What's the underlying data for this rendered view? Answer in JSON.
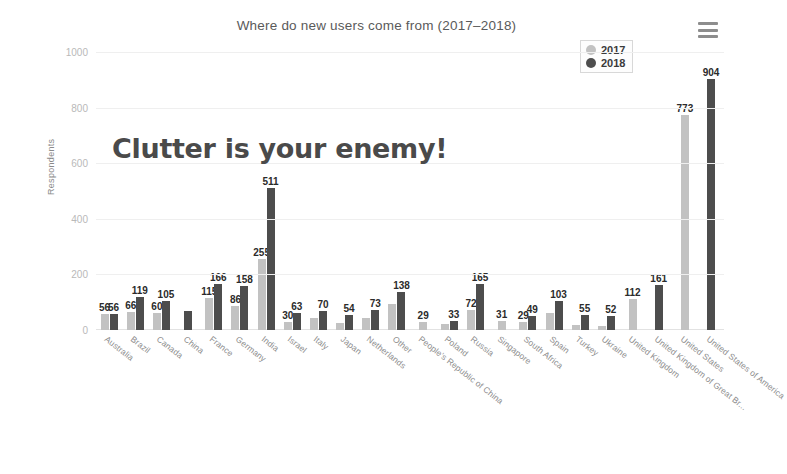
{
  "chart_data": {
    "type": "bar",
    "title": "Where do new users come from (2017–2018)",
    "xlabel": "",
    "ylabel": "Respondents",
    "ylim": [
      0,
      1000
    ],
    "yticks": [
      0,
      200,
      400,
      600,
      800,
      1000
    ],
    "grid": true,
    "legend_position": "top-right",
    "categories": [
      "Australia",
      "Brazil",
      "Canada",
      "China",
      "France",
      "Germany",
      "India",
      "Israel",
      "Italy",
      "Japan",
      "Netherlands",
      "Other",
      "People's Republic of China",
      "Poland",
      "Russia",
      "Singapore",
      "South Africa",
      "Spain",
      "Turkey",
      "Ukraine",
      "United Kingdom",
      "United Kingdom of Great Br...",
      "United States",
      "United States of America"
    ],
    "series": [
      {
        "name": "2017",
        "color": "#c2c2c2",
        "values": [
          56,
          66,
          60,
          null,
          115,
          86,
          255,
          30,
          42,
          24,
          44,
          95,
          29,
          22,
          72,
          31,
          29,
          62,
          18,
          16,
          112,
          null,
          773,
          null
        ]
      },
      {
        "name": "2018",
        "color": "#4d4d4d",
        "values": [
          56,
          119,
          105,
          70,
          166,
          158,
          511,
          63,
          70,
          54,
          73,
          138,
          null,
          33,
          165,
          null,
          49,
          103,
          55,
          52,
          null,
          161,
          null,
          904
        ]
      }
    ],
    "data_labels": [
      {
        "category": "Australia",
        "text": "56"
      },
      {
        "category": "Brazil",
        "text": "66"
      },
      {
        "category": "Brazil",
        "text": "119"
      },
      {
        "category": "Canada",
        "text": "60"
      },
      {
        "category": "Canada",
        "text": "105"
      },
      {
        "category": "France",
        "text": "115"
      },
      {
        "category": "France",
        "text": "166"
      },
      {
        "category": "Germany",
        "text": "86"
      },
      {
        "category": "Germany",
        "text": "158"
      },
      {
        "category": "India",
        "text": "255"
      },
      {
        "category": "India",
        "text": "511"
      },
      {
        "category": "Israel",
        "text": "30"
      },
      {
        "category": "Israel",
        "text": "63"
      },
      {
        "category": "Italy",
        "text": "70"
      },
      {
        "category": "Japan",
        "text": "54"
      },
      {
        "category": "Netherlands",
        "text": "73"
      },
      {
        "category": "Other",
        "text": "138"
      },
      {
        "category": "People's Republic of China",
        "text": "29"
      },
      {
        "category": "Poland",
        "text": "33"
      },
      {
        "category": "Russia",
        "text": "72"
      },
      {
        "category": "Russia",
        "text": "165"
      },
      {
        "category": "Singapore",
        "text": "31"
      },
      {
        "category": "South Africa",
        "text": "29"
      },
      {
        "category": "South Africa",
        "text": "49"
      },
      {
        "category": "Spain",
        "text": "103"
      },
      {
        "category": "Turkey",
        "text": "55"
      },
      {
        "category": "Ukraine",
        "text": "52"
      },
      {
        "category": "United Kingdom",
        "text": "112"
      },
      {
        "category": "United Kingdom of Great Br...",
        "text": "161"
      },
      {
        "category": "United States",
        "text": "773"
      },
      {
        "category": "United States of America",
        "text": "904"
      }
    ]
  },
  "annotation": {
    "text": "Clutter is your enemy!"
  },
  "legend": {
    "items": [
      {
        "label": "2017",
        "color": "#c2c2c2"
      },
      {
        "label": "2018",
        "color": "#4d4d4d"
      }
    ]
  },
  "toolbar": {
    "menu_icon": "hamburger-menu-icon"
  }
}
